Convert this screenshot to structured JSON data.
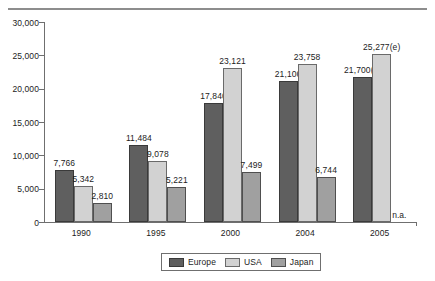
{
  "chart_data": {
    "type": "bar",
    "title": "",
    "subtitle": "",
    "xlabel": "",
    "ylabel": "",
    "categories": [
      "1990",
      "1995",
      "2000",
      "2004",
      "2005"
    ],
    "ylim": [
      0,
      30000
    ],
    "yticks": [
      0,
      5000,
      10000,
      15000,
      20000,
      25000,
      30000
    ],
    "ytick_labels": [
      "0",
      "5,000",
      "10,000",
      "15,000",
      "20,000",
      "25,000",
      "30,000"
    ],
    "grid": false,
    "legend_position": "bottom-center",
    "series": [
      {
        "name": "Europe",
        "color": "#5f5f5f",
        "values": [
          7766,
          11484,
          17840,
          21106,
          21700
        ],
        "labels": [
          "7,766",
          "11,484",
          "17,840",
          "21,106",
          "21,700(e)"
        ]
      },
      {
        "name": "USA",
        "color": "#d2d2d2",
        "values": [
          5342,
          9078,
          23121,
          23758,
          25277
        ],
        "labels": [
          "5,342",
          "9,078",
          "23,121",
          "23,758",
          "25,277(e)"
        ]
      },
      {
        "name": "Japan",
        "color": "#a0a0a0",
        "values": [
          2810,
          5221,
          7499,
          6744,
          null
        ],
        "labels": [
          "2,810",
          "5,221",
          "7,499",
          "6,744",
          "n.a."
        ]
      }
    ],
    "annotations": [
      {
        "text": "n.a.",
        "category": "2005",
        "series": "Japan"
      }
    ]
  },
  "legend": {
    "items": [
      {
        "label": "Europe",
        "swatch": "europe-swatch"
      },
      {
        "label": "USA",
        "swatch": "usa-swatch"
      },
      {
        "label": "Japan",
        "swatch": "japan-swatch"
      }
    ]
  }
}
